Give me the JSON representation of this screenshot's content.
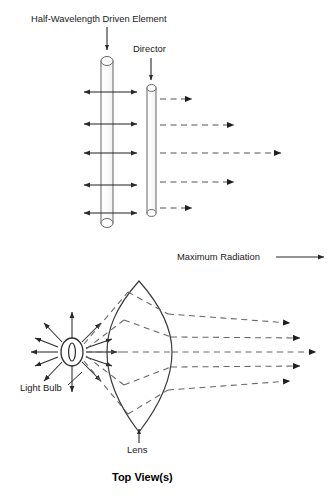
{
  "figure": {
    "caption": "Top View(s)",
    "background_color": "#ffffff",
    "line_color": "#3a3a3a",
    "text_color": "#1a1a1a"
  },
  "panel_antenna": {
    "labels": {
      "driven_element": "Half-Wavelength Driven Element",
      "director": "Director",
      "maximum_radiation": "Maximum Radiation"
    },
    "driven_element": {
      "x_left": 101,
      "x_right": 113,
      "y_top": 56,
      "y_bottom": 228
    },
    "director": {
      "x_left": 147,
      "x_right": 156,
      "y_top": 85,
      "y_bottom": 216
    },
    "bidirectional_rows_y": [
      92,
      124,
      153,
      185,
      213
    ],
    "solid_arrow_left_tip_x": 84,
    "solid_arrow_right_tip_x": 137,
    "forward_dashed_rays": [
      {
        "y": 99,
        "x_start": 160,
        "x_end": 192
      },
      {
        "y": 125,
        "x_start": 160,
        "x_end": 234
      },
      {
        "y": 153,
        "x_start": 160,
        "x_end": 281
      },
      {
        "y": 182,
        "x_start": 160,
        "x_end": 234
      },
      {
        "y": 208,
        "x_start": 160,
        "x_end": 192
      }
    ],
    "max_radiation_arrow": {
      "y": 257,
      "x_start": 276,
      "x_end": 324
    }
  },
  "panel_lens": {
    "labels": {
      "light_bulb": "Light Bulb",
      "lens": "Lens"
    },
    "bulb": {
      "cx": 72,
      "cy": 352,
      "rx": 11,
      "ry": 14
    },
    "bulb_ray_count": 12,
    "bulb_ray_length": 30,
    "lens": {
      "cx": 139,
      "cy": 352,
      "top_y": 281,
      "bottom_y": 432,
      "left_x": 107,
      "right_x": 172
    },
    "output_rays": [
      {
        "y_out": 323,
        "x_end": 290
      },
      {
        "y_out": 338,
        "x_end": 300
      },
      {
        "y_out": 352,
        "x_end": 316
      },
      {
        "y_out": 366,
        "x_end": 300
      },
      {
        "y_out": 381,
        "x_end": 290
      }
    ]
  }
}
